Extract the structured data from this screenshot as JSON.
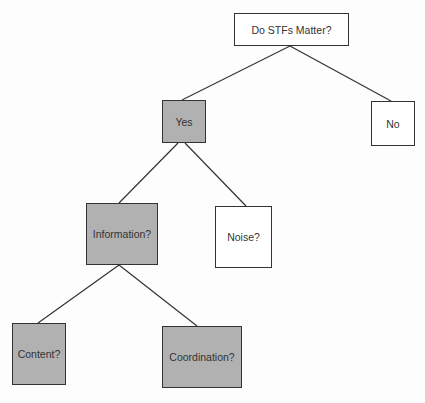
{
  "diagram": {
    "type": "decision-tree",
    "colors": {
      "filled": "#b1b1b1",
      "empty": "#ffffff",
      "line": "#333333"
    },
    "nodes": [
      {
        "id": "root",
        "label": "Do STFs Matter?",
        "fill": "empty",
        "box": [
          234,
          13,
          115,
          33
        ]
      },
      {
        "id": "yes",
        "label": "Yes",
        "fill": "filled",
        "box": [
          162,
          100,
          44,
          43
        ]
      },
      {
        "id": "no",
        "label": "No",
        "fill": "empty",
        "box": [
          371,
          101,
          44,
          45
        ]
      },
      {
        "id": "information",
        "label": "Information?",
        "fill": "filled",
        "box": [
          86,
          203,
          72,
          62
        ]
      },
      {
        "id": "noise",
        "label": "Noise?",
        "fill": "empty",
        "box": [
          215,
          206,
          57,
          62
        ]
      },
      {
        "id": "content",
        "label": "Content?",
        "fill": "filled",
        "box": [
          12,
          323,
          54,
          62
        ]
      },
      {
        "id": "coordination",
        "label": "Coordination?",
        "fill": "filled",
        "box": [
          162,
          326,
          80,
          62
        ]
      }
    ],
    "edges": [
      {
        "from": "root",
        "to": "yes",
        "line": [
          290,
          46,
          182,
          100
        ]
      },
      {
        "from": "root",
        "to": "no",
        "line": [
          290,
          46,
          391,
          101
        ]
      },
      {
        "from": "yes",
        "to": "information",
        "line": [
          178,
          143,
          119,
          203
        ]
      },
      {
        "from": "yes",
        "to": "noise",
        "line": [
          185,
          143,
          246,
          206
        ]
      },
      {
        "from": "information",
        "to": "content",
        "line": [
          119,
          265,
          38,
          323
        ]
      },
      {
        "from": "information",
        "to": "coordination",
        "line": [
          119,
          265,
          197,
          326
        ]
      }
    ]
  }
}
